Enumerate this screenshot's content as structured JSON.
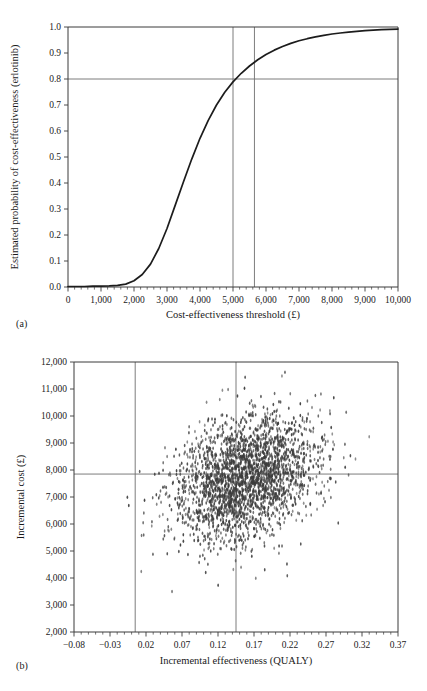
{
  "figure": {
    "panel_a_tag": "(a)",
    "panel_b_tag": "(b)",
    "caption_partial": ""
  },
  "chart_data": [
    {
      "id": "panel-a",
      "type": "line",
      "title": "",
      "xlabel": "Cost-effectiveness threshold (£)",
      "ylabel": "Estimated probability of cost-effectiveness (erlotinib)",
      "xlim": [
        0,
        10000
      ],
      "ylim": [
        0.0,
        1.0
      ],
      "grid": false,
      "xticks": [
        0,
        1000,
        2000,
        3000,
        4000,
        5000,
        6000,
        7000,
        8000,
        9000,
        10000
      ],
      "xticklabels": [
        "0",
        "1,000",
        "2,000",
        "3,000",
        "4,000",
        "5,000",
        "6,000",
        "7,000",
        "8,000",
        "9,000",
        "10,000"
      ],
      "yticks": [
        0.0,
        0.1,
        0.2,
        0.3,
        0.4,
        0.5,
        0.6,
        0.7,
        0.8,
        0.9,
        1.0
      ],
      "yticklabels": [
        "0.0",
        "0.1",
        "0.2",
        "0.3",
        "0.4",
        "0.5",
        "0.6",
        "0.7",
        "0.8",
        "0.9",
        "1.0"
      ],
      "reference_lines": [
        {
          "orientation": "horizontal",
          "value": 0.8
        },
        {
          "orientation": "vertical",
          "value": 5000
        },
        {
          "orientation": "vertical",
          "value": 5650
        }
      ],
      "series": [
        {
          "name": "Cost-effectiveness acceptability curve",
          "x": [
            0,
            250,
            500,
            750,
            1000,
            1250,
            1500,
            1750,
            2000,
            2250,
            2500,
            2750,
            3000,
            3250,
            3500,
            3750,
            4000,
            4250,
            4500,
            4750,
            5000,
            5250,
            5500,
            5750,
            6000,
            6250,
            6500,
            6750,
            7000,
            7250,
            7500,
            7750,
            8000,
            8250,
            8500,
            8750,
            9000,
            9250,
            9500,
            9750,
            10000
          ],
          "y": [
            0.002,
            0.002,
            0.002,
            0.003,
            0.003,
            0.004,
            0.006,
            0.011,
            0.024,
            0.048,
            0.088,
            0.148,
            0.225,
            0.315,
            0.405,
            0.492,
            0.572,
            0.641,
            0.7,
            0.749,
            0.789,
            0.822,
            0.85,
            0.874,
            0.894,
            0.911,
            0.925,
            0.937,
            0.947,
            0.955,
            0.962,
            0.968,
            0.973,
            0.977,
            0.98,
            0.983,
            0.986,
            0.988,
            0.99,
            0.991,
            0.992
          ]
        }
      ]
    },
    {
      "id": "panel-b",
      "type": "scatter",
      "title": "",
      "xlabel": "Incremental effectiveness (QUALY)",
      "ylabel": "Incremental cost (£)",
      "xlim": [
        -0.08,
        0.37
      ],
      "ylim": [
        2000,
        12000
      ],
      "grid": false,
      "xticks": [
        -0.08,
        -0.03,
        0.02,
        0.07,
        0.12,
        0.17,
        0.22,
        0.27,
        0.32,
        0.37
      ],
      "xticklabels": [
        "−0.08",
        "−0.03",
        "0.02",
        "0.07",
        "0.12",
        "0.17",
        "0.22",
        "0.27",
        "0.32",
        "0.37"
      ],
      "yticks": [
        2000,
        3000,
        4000,
        5000,
        6000,
        7000,
        8000,
        9000,
        10000,
        11000,
        12000
      ],
      "yticklabels": [
        "2,000",
        "3,000",
        "4,000",
        "5,000",
        "6,000",
        "7,000",
        "8,000",
        "9,000",
        "10,000",
        "11,000",
        "12,000"
      ],
      "reference_lines": [
        {
          "orientation": "horizontal",
          "value": 7850
        },
        {
          "orientation": "vertical",
          "value": 0.005
        },
        {
          "orientation": "vertical",
          "value": 0.145
        }
      ],
      "cloud": {
        "n_points": 2600,
        "mean_x": 0.158,
        "mean_y": 7720,
        "sd_x": 0.048,
        "sd_y": 1180,
        "marker": "vertical-ellipse",
        "marker_color": "#3c3c3c"
      }
    }
  ]
}
